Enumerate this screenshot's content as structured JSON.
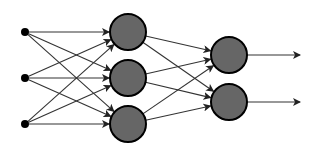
{
  "diagram": {
    "title": "",
    "type": "neural-network",
    "colors": {
      "background": "#ffffff",
      "node_fill": "#666666",
      "node_stroke": "#000000",
      "input_fill": "#000000",
      "edge": "#333333"
    },
    "layers": [
      {
        "name": "input",
        "nodes": [
          {
            "id": "i1",
            "x": 25,
            "y": 32,
            "r": 4
          },
          {
            "id": "i2",
            "x": 25,
            "y": 78,
            "r": 4
          },
          {
            "id": "i3",
            "x": 25,
            "y": 124,
            "r": 4
          }
        ]
      },
      {
        "name": "hidden",
        "nodes": [
          {
            "id": "h1",
            "x": 128,
            "y": 32,
            "r": 18
          },
          {
            "id": "h2",
            "x": 128,
            "y": 78,
            "r": 18
          },
          {
            "id": "h3",
            "x": 128,
            "y": 124,
            "r": 18
          }
        ]
      },
      {
        "name": "output",
        "nodes": [
          {
            "id": "o1",
            "x": 229,
            "y": 55,
            "r": 18
          },
          {
            "id": "o2",
            "x": 229,
            "y": 102,
            "r": 18
          }
        ]
      }
    ],
    "output_arrows": [
      {
        "from": "o1",
        "to_x": 300
      },
      {
        "from": "o2",
        "to_x": 300
      }
    ],
    "connectivity": "fully-connected"
  }
}
